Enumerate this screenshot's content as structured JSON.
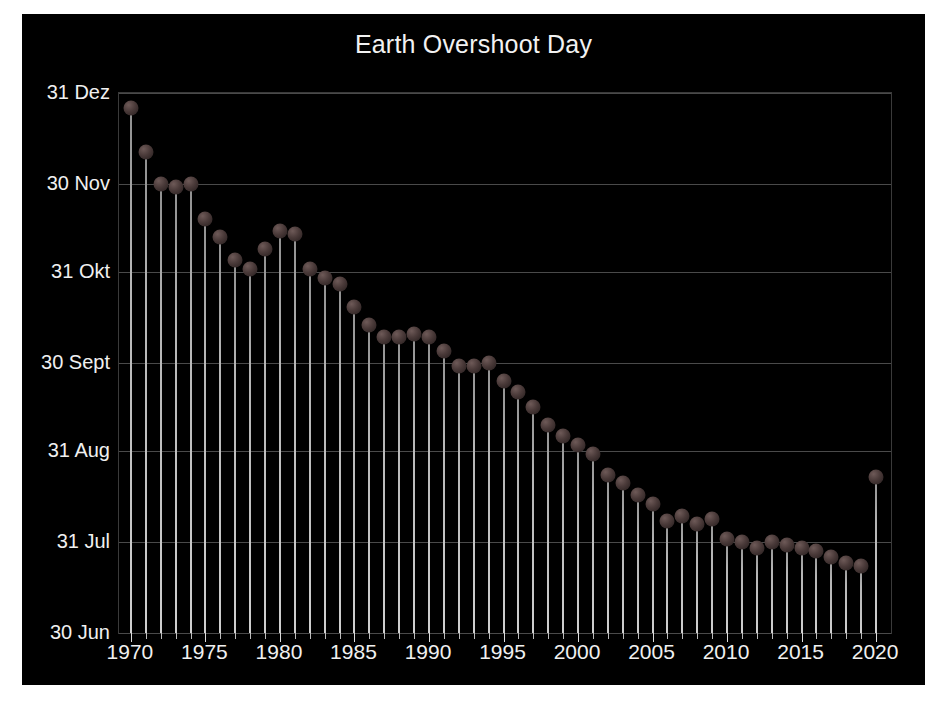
{
  "figure": {
    "background_color": "#000000",
    "page_background_color": "#ffffff",
    "axis_color": "#3a3a3a",
    "grid_color": "#4a4a4a",
    "text_color": "#f0f0f0",
    "marker_color": "#4a3a39",
    "stem_color": "#c8c8c8"
  },
  "chart_data": {
    "type": "line",
    "title": "Earth Overshoot Day",
    "xlabel": "",
    "ylabel": "",
    "grid": true,
    "legend": "none",
    "xlim": [
      1969.2,
      2021.0
    ],
    "ylim": [
      181,
      365
    ],
    "ytick_labels": [
      "31 Dez",
      "30 Nov",
      "31 Okt",
      "30 Sept",
      "31 Aug",
      "31 Jul",
      "30 Jun"
    ],
    "ytick_values": [
      365,
      334,
      304,
      273,
      243,
      212,
      181
    ],
    "xtick_labels": [
      "1970",
      "1975",
      "1980",
      "1985",
      "1990",
      "1995",
      "2000",
      "2005",
      "2010",
      "2015",
      "2020"
    ],
    "xtick_values": [
      1970,
      1975,
      1980,
      1985,
      1990,
      1995,
      2000,
      2005,
      2010,
      2015,
      2020
    ],
    "x": [
      1970,
      1971,
      1972,
      1973,
      1974,
      1975,
      1976,
      1977,
      1978,
      1979,
      1980,
      1981,
      1982,
      1983,
      1984,
      1985,
      1986,
      1987,
      1988,
      1989,
      1990,
      1991,
      1992,
      1993,
      1994,
      1995,
      1996,
      1997,
      1998,
      1999,
      2000,
      2001,
      2002,
      2003,
      2004,
      2005,
      2006,
      2007,
      2008,
      2009,
      2010,
      2011,
      2012,
      2013,
      2014,
      2015,
      2016,
      2017,
      2018,
      2019,
      2020
    ],
    "values": [
      360,
      345,
      334,
      333,
      334,
      322,
      316,
      308,
      305,
      312,
      318,
      317,
      305,
      302,
      300,
      292,
      286,
      282,
      282,
      283,
      282,
      277,
      272,
      272,
      273,
      267,
      263,
      258,
      252,
      248,
      245,
      242,
      235,
      232,
      228,
      225,
      219,
      221,
      218,
      220,
      213,
      212,
      210,
      212,
      211,
      210,
      209,
      207,
      205,
      204,
      234
    ],
    "value_labels": [
      "29 Dez",
      "14 Dez",
      "3 Dez",
      "2 Dez",
      "3 Dez",
      "21 Nov",
      "15 Nov",
      "7 Nov",
      "4 Nov",
      "11 Nov",
      "17 Nov",
      "16 Nov",
      "4 Nov",
      "1 Nov",
      "30 Okt",
      "22 Okt",
      "16 Okt",
      "12 Okt",
      "12 Okt",
      "13 Okt",
      "12 Okt",
      "7 Okt",
      "2 Okt",
      "2 Okt",
      "3 Okt",
      "27 Sept",
      "23 Sept",
      "18 Sept",
      "12 Sept",
      "8 Sept",
      "5 Sept",
      "2 Sept",
      "26 Aug",
      "23 Aug",
      "19 Aug",
      "16 Aug",
      "10 Aug",
      "12 Aug",
      "9 Aug",
      "11 Aug",
      "4 Aug",
      "3 Aug",
      "1 Aug",
      "3 Aug",
      "2 Aug",
      "1 Aug",
      "31 Jul",
      "29 Jul",
      "27 Jul",
      "26 Jul",
      "22 Aug"
    ]
  }
}
